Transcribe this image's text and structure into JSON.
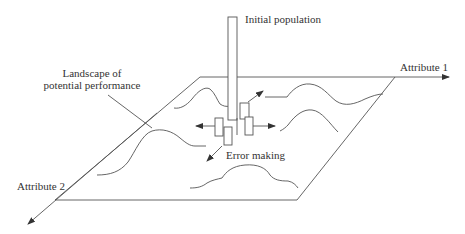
{
  "diagram": {
    "type": "conceptual-landscape",
    "labels": {
      "initial_population": "Initial population",
      "attribute_1": "Attribute 1",
      "attribute_2": "Attribute 2",
      "landscape_line1": "Landscape of",
      "landscape_line2": "potential performance",
      "error_making": "Error making"
    },
    "elements": {
      "plane": "parallelogram landscape plane",
      "axes": [
        "Attribute 1 (horizontal, right)",
        "Attribute 2 (diagonal, down-left)"
      ],
      "curves": 5,
      "population_bars": 5,
      "arrows": [
        "up-right",
        "left",
        "right",
        "down-left"
      ]
    },
    "colors": {
      "stroke": "#555555",
      "text": "#333333",
      "background": "#ffffff"
    }
  }
}
